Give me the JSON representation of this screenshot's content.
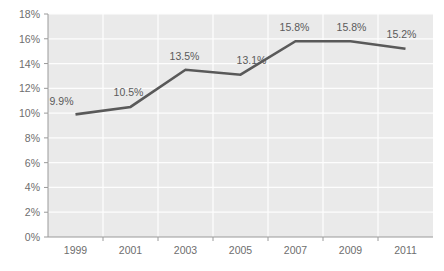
{
  "chart_data": {
    "type": "line",
    "title": "",
    "subtitle": "",
    "xlabel": "",
    "ylabel": "",
    "categories": [
      "1999",
      "2001",
      "2003",
      "2005",
      "2007",
      "2009",
      "2011"
    ],
    "x": [
      1999,
      2001,
      2003,
      2005,
      2007,
      2009,
      2011
    ],
    "values": [
      9.9,
      10.5,
      13.5,
      13.1,
      15.8,
      15.8,
      15.2
    ],
    "point_labels": [
      "9.9%",
      "10.5%",
      "13.5%",
      "13.1%",
      "15.8%",
      "15.8%",
      "15.2%"
    ],
    "ylim": [
      0,
      18
    ],
    "xlim": [
      1998,
      2012
    ],
    "y_ticks": [
      0,
      2,
      4,
      6,
      8,
      10,
      12,
      14,
      16,
      18
    ],
    "y_tick_labels": [
      "0%",
      "2%",
      "4%",
      "6%",
      "8%",
      "10%",
      "12%",
      "14%",
      "16%",
      "18%"
    ],
    "x_tick_labels": [
      "1999",
      "2001",
      "2003",
      "2005",
      "2007",
      "2009",
      "2011"
    ],
    "grid": true,
    "grid_axis": "both",
    "legend": false,
    "legend_position": "none",
    "series": [
      {
        "name": "",
        "values": [
          9.9,
          10.5,
          13.5,
          13.1,
          15.8,
          15.8,
          15.2
        ]
      }
    ]
  },
  "style": {
    "line_color": "#595959",
    "plot_background": "#eaeaea",
    "grid_color": "#fdfdfd",
    "axis_color": "#9a9a9a",
    "tick_label_color": "#6e6e6e",
    "point_label_color": "#5a5a5a",
    "page_background": "#ffffff",
    "line_width": "2.6"
  }
}
